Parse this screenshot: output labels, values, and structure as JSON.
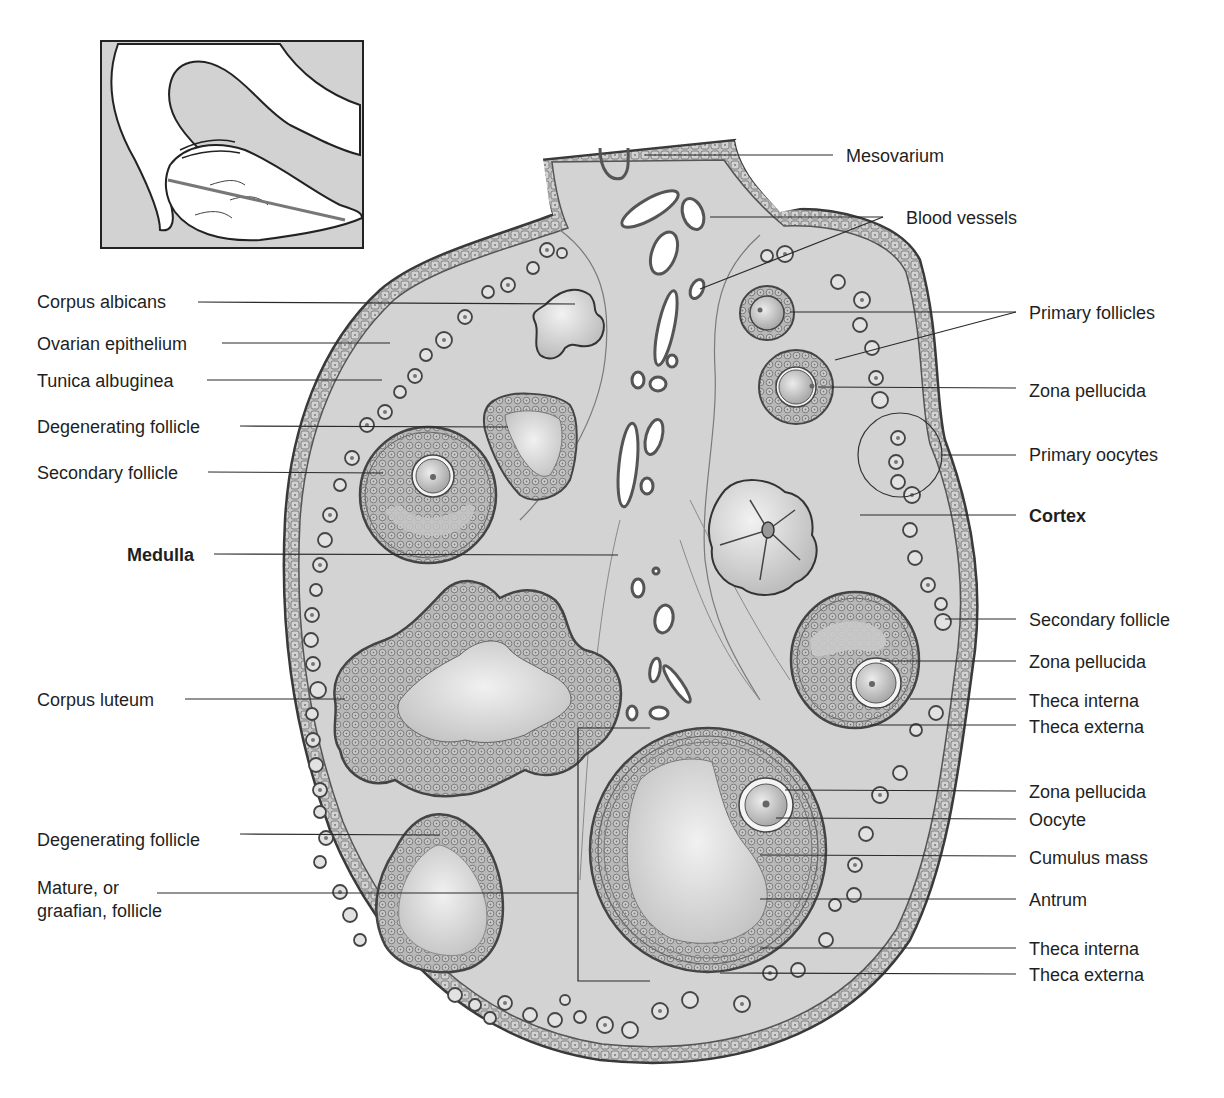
{
  "figure": {
    "colors": {
      "tissue": "#cfcfcf",
      "tissue_light": "#dedede",
      "outline": "#3a3a3a",
      "cell_fill": "#bdbdbd",
      "cavity": "#e9e9e9",
      "inset_bg": "#d2d2d2",
      "leader_line": "#2a2a2a"
    }
  },
  "inset": {
    "description": "Orientation sketch of ovary with uterine tube and section plane line"
  },
  "labels_left": [
    {
      "id": "corpus-albicans",
      "text": "Corpus albicans",
      "bold": false
    },
    {
      "id": "ovarian-epithelium",
      "text": "Ovarian epithelium",
      "bold": false
    },
    {
      "id": "tunica-albuginea",
      "text": "Tunica albuginea",
      "bold": false
    },
    {
      "id": "degenerating-follicle-upper",
      "text": "Degenerating follicle",
      "bold": false
    },
    {
      "id": "secondary-follicle-left",
      "text": "Secondary follicle",
      "bold": false
    },
    {
      "id": "medulla",
      "text": "Medulla",
      "bold": true
    },
    {
      "id": "corpus-luteum",
      "text": "Corpus luteum",
      "bold": false
    },
    {
      "id": "degenerating-follicle-lower",
      "text": "Degenerating follicle",
      "bold": false
    },
    {
      "id": "mature-follicle-line1",
      "text": "Mature, or",
      "bold": false
    },
    {
      "id": "mature-follicle-line2",
      "text": "graafian, follicle",
      "bold": false
    }
  ],
  "labels_right": [
    {
      "id": "mesovarium",
      "text": "Mesovarium",
      "bold": false
    },
    {
      "id": "blood-vessels",
      "text": "Blood vessels",
      "bold": false
    },
    {
      "id": "primary-follicles",
      "text": "Primary follicles",
      "bold": false
    },
    {
      "id": "zona-pellucida-1",
      "text": "Zona  pellucida",
      "bold": false
    },
    {
      "id": "primary-oocytes",
      "text": "Primary oocytes",
      "bold": false
    },
    {
      "id": "cortex",
      "text": "Cortex",
      "bold": true
    },
    {
      "id": "secondary-follicle-right",
      "text": "Secondary follicle",
      "bold": false
    },
    {
      "id": "zona-pellucida-2",
      "text": "Zona  pellucida",
      "bold": false
    },
    {
      "id": "theca-interna-1",
      "text": "Theca interna",
      "bold": false
    },
    {
      "id": "theca-externa-1",
      "text": "Theca externa",
      "bold": false
    },
    {
      "id": "zona-pellucida-3",
      "text": "Zona  pellucida",
      "bold": false
    },
    {
      "id": "oocyte",
      "text": "Oocyte",
      "bold": false
    },
    {
      "id": "cumulus-mass",
      "text": "Cumulus mass",
      "bold": false
    },
    {
      "id": "antrum",
      "text": "Antrum",
      "bold": false
    },
    {
      "id": "theca-interna-2",
      "text": "Theca interna",
      "bold": false
    },
    {
      "id": "theca-externa-2",
      "text": "Theca externa",
      "bold": false
    }
  ]
}
